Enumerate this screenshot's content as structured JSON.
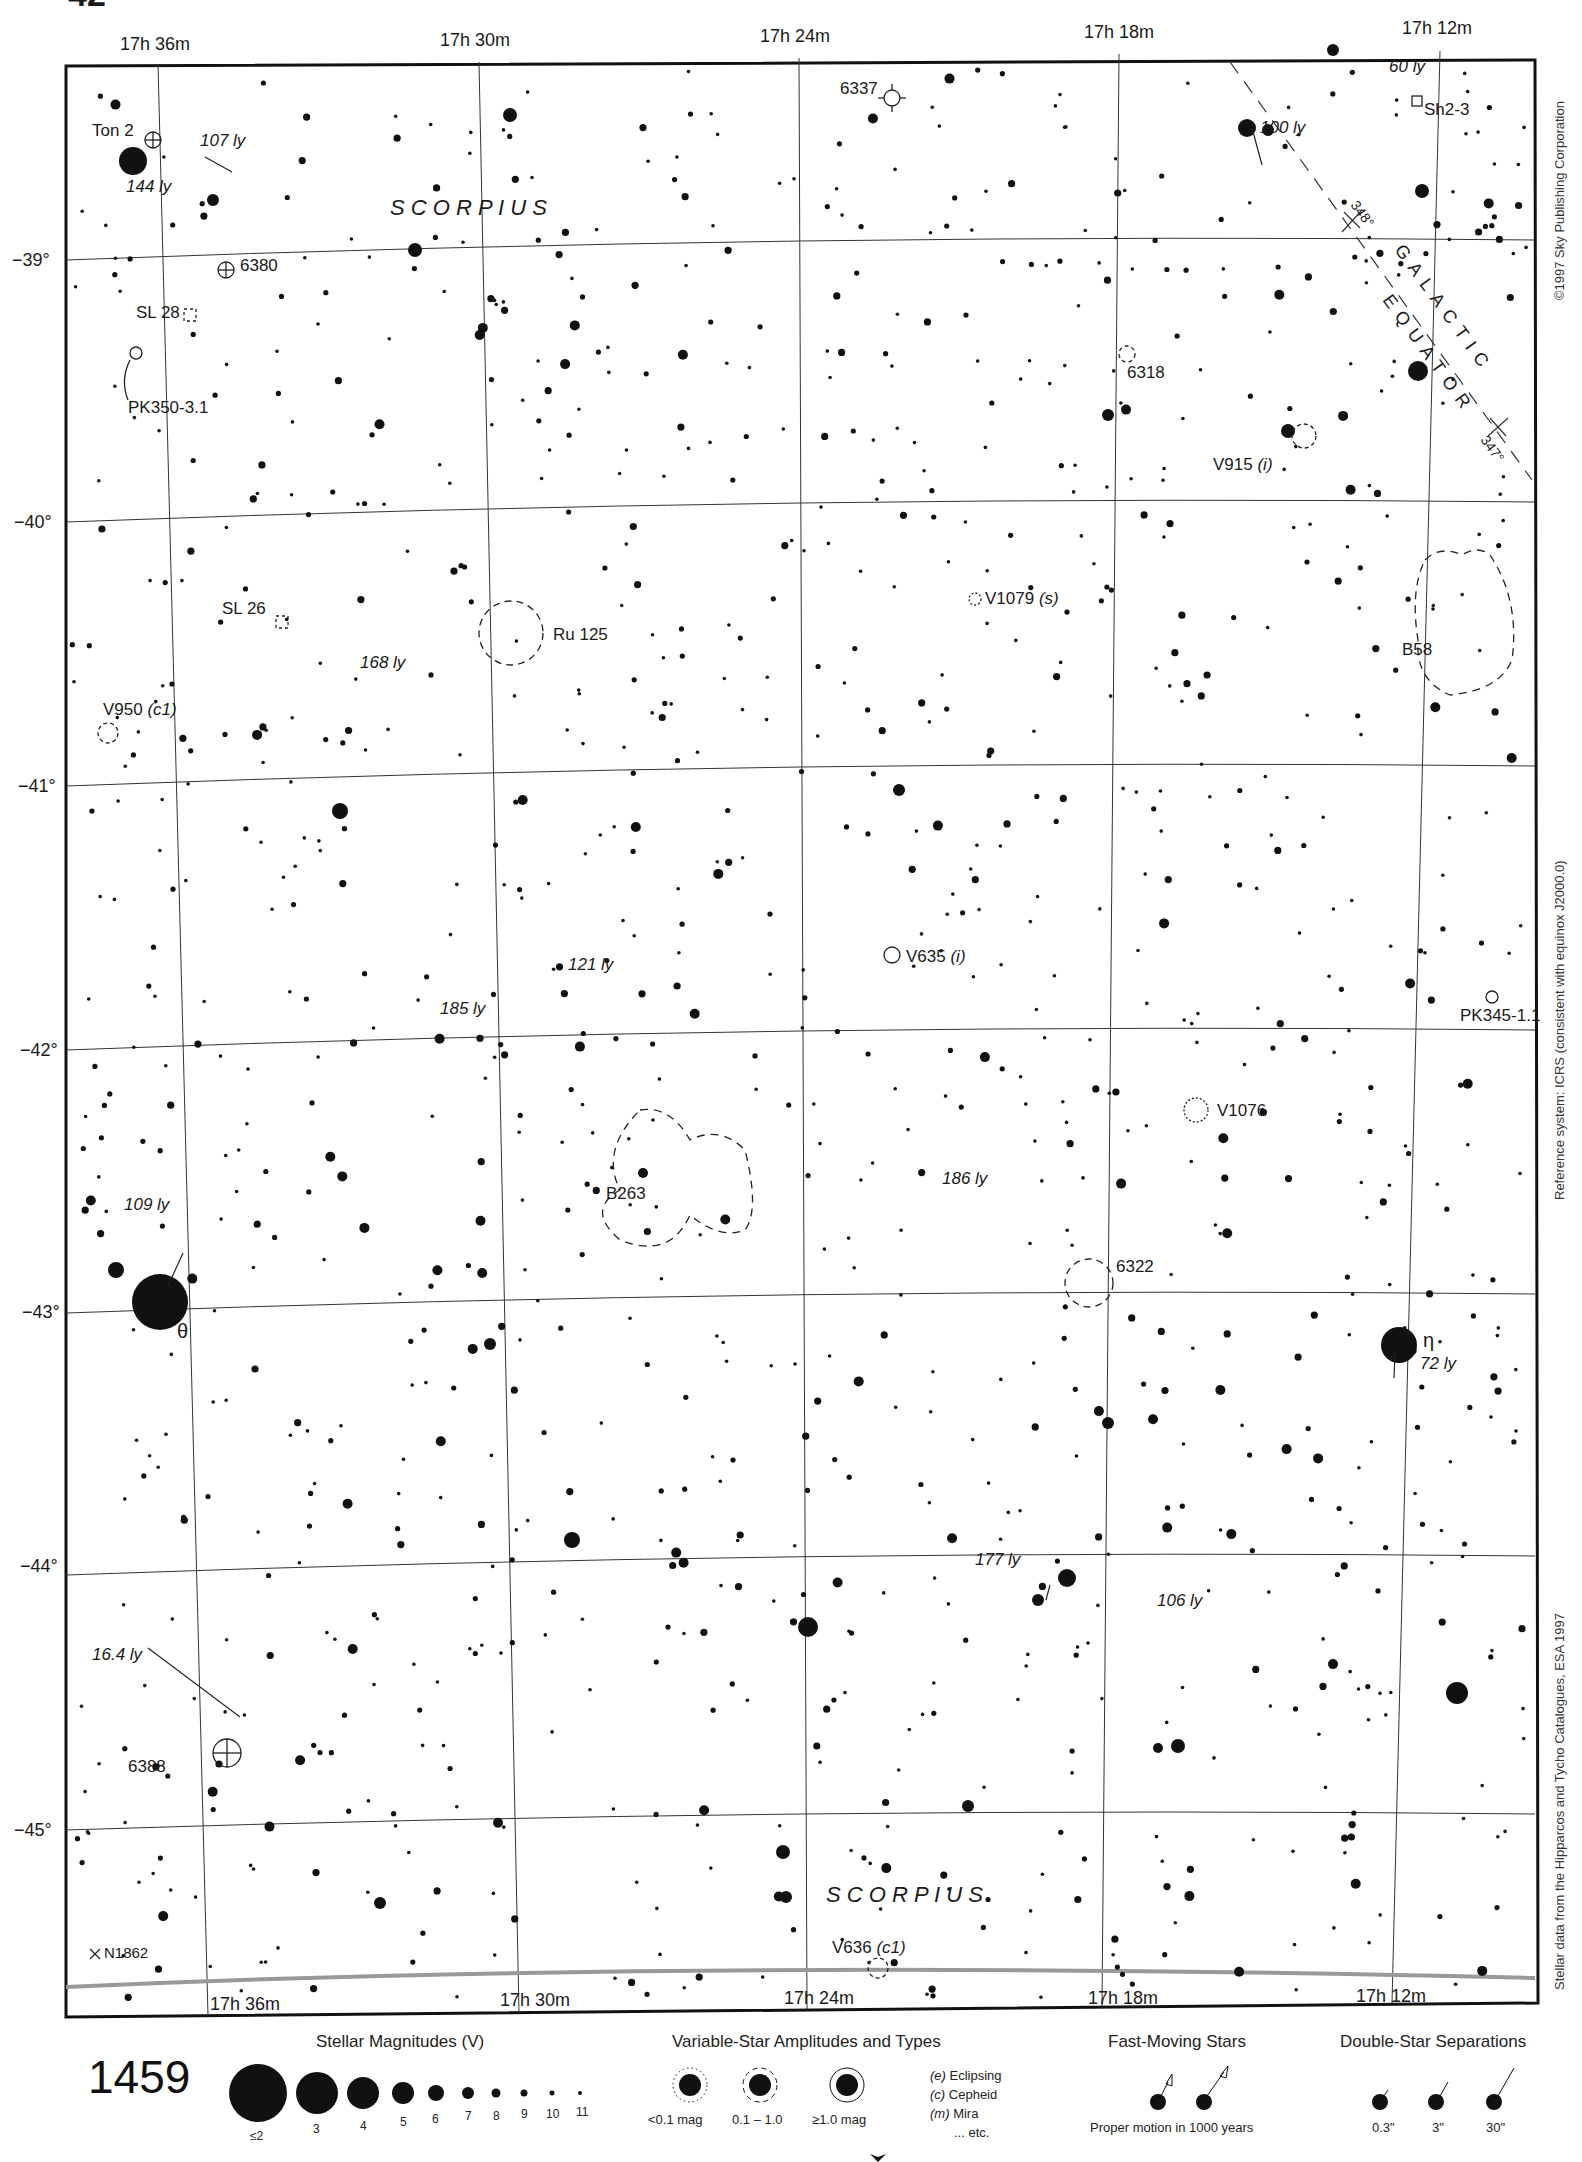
{
  "page": {
    "number": "1459",
    "top_corner_fragment": "42",
    "next_page_below": "1479",
    "constellation": "SCORPIUS"
  },
  "axes": {
    "ra_top": [
      "17h 36m",
      "17h 30m",
      "17h 24m",
      "17h 18m",
      "17h 12m"
    ],
    "ra_bottom": [
      "17h 36m",
      "17h 30m",
      "17h 24m",
      "17h 18m",
      "17h 12m"
    ],
    "dec_left": [
      "−39°",
      "−40°",
      "−41°",
      "−42°",
      "−43°",
      "−44°",
      "−45°"
    ]
  },
  "galactic_equator": {
    "label_line1": "GALACTIC",
    "label_line2": "EQUATOR",
    "ticks": [
      "348°",
      "347°"
    ]
  },
  "labels": {
    "ton2": "Ton 2",
    "ly107": "107 ly",
    "ly144": "144 ly",
    "scorpius_top": "S C O R P I U S",
    "ngc6380": "6380",
    "sl28": "SL 28",
    "pk350": "PK350-3.1",
    "ngc6337": "6337",
    "ly100": "100 ly",
    "ly60": "60 ly",
    "sh23": "Sh2-3",
    "ngc6318": "6318",
    "v915": "V915",
    "v915_type": "(i)",
    "sl26": "SL 26",
    "ru125": "Ru 125",
    "ly168": "168 ly",
    "v950": "V950",
    "v950_type": "(c1)",
    "v1079": "V1079",
    "v1079_type": "(s)",
    "b58": "B58",
    "ly121": "121 ly",
    "v635": "V635",
    "v635_type": "(i)",
    "ly185": "185 ly",
    "pk345": "PK345-1.1",
    "v1076": "V1076",
    "b263": "B263",
    "ly186": "186 ly",
    "ly109": "109 ly",
    "ngc6322": "6322",
    "theta": "θ",
    "eta": "η",
    "ly72": "72 ly",
    "ly177": "177 ly",
    "ly106": "106 ly",
    "ly16": "16.4 ly",
    "ngc6388": "6388",
    "scorpius_bottom": "S C O R P I U S",
    "v636": "V636",
    "v636_type": "(c1)",
    "n1862": "N1862"
  },
  "side_text": {
    "copyright": "©1997 Sky Publishing Corporation",
    "reference": "Reference system: ICRS (consistent with equinox J2000.0)",
    "source": "Stellar data from the Hipparcos and Tycho Catalogues, ESA 1997"
  },
  "legend": {
    "magnitudes": {
      "title": "Stellar Magnitudes (V)",
      "items": [
        "≤2",
        "3",
        "4",
        "5",
        "6",
        "7",
        "8",
        "9",
        "10",
        "11"
      ]
    },
    "variables": {
      "title": "Variable-Star Amplitudes and Types",
      "amplitudes": [
        "<0.1 mag",
        "0.1 – 1.0",
        "≥1.0 mag"
      ],
      "types": [
        {
          "code": "(e)",
          "name": "Eclipsing"
        },
        {
          "code": "(c)",
          "name": "Cepheid"
        },
        {
          "code": "(m)",
          "name": "Mira"
        },
        {
          "code": "",
          "name": "... etc."
        }
      ]
    },
    "fast_moving": {
      "title": "Fast-Moving Stars",
      "caption": "Proper motion in 1000 years"
    },
    "doubles": {
      "title": "Double-Star Separations",
      "items": [
        "0.3\"",
        "3\"",
        "30\""
      ]
    }
  }
}
